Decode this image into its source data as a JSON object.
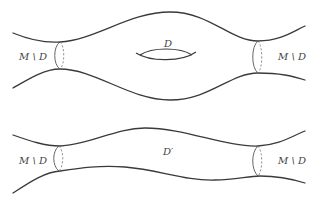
{
  "figure": {
    "top_surface": {
      "labels": {
        "left_region": "M \\ D",
        "right_region": "M \\ D",
        "disk": "D"
      }
    },
    "bottom_surface": {
      "labels": {
        "left_region": "M \\ D",
        "right_region": "M \\ D",
        "disk": "D′"
      }
    },
    "colors": {
      "stroke": "#3a3a3a",
      "text": "#444444",
      "background": "#ffffff"
    }
  }
}
